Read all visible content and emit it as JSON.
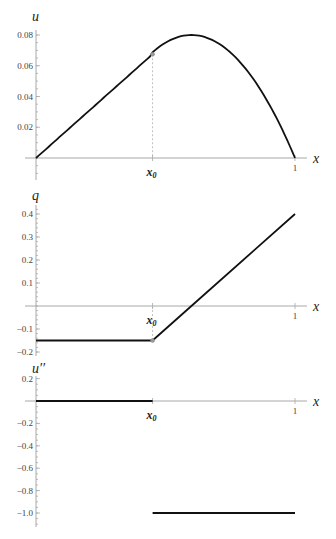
{
  "chart_data": [
    {
      "type": "line",
      "title": "",
      "ylabel": "u",
      "xlabel": "x",
      "x0": 0.45,
      "x0_label": "x0",
      "xlim": [
        0,
        1
      ],
      "ylim": [
        0,
        0.08
      ],
      "yticks": [
        0.02,
        0.04,
        0.06,
        0.08
      ],
      "ytick_labels": [
        "0.02",
        "0.04",
        "0.06",
        "0.08"
      ],
      "xticks": [
        1
      ],
      "xtick_labels": [
        "1"
      ],
      "grid": false,
      "series": [
        {
          "name": "u",
          "x": [
            0,
            0.1,
            0.2,
            0.3,
            0.45,
            0.5,
            0.55,
            0.6,
            0.65,
            0.7,
            0.75,
            0.8,
            0.85,
            0.9,
            0.95,
            1.0
          ],
          "values": [
            0,
            0.015,
            0.03,
            0.045,
            0.06875,
            0.075,
            0.07875,
            0.08,
            0.07875,
            0.075,
            0.06875,
            0.06,
            0.04875,
            0.035,
            0.01875,
            0
          ]
        }
      ]
    },
    {
      "type": "line",
      "title": "",
      "ylabel": "q",
      "xlabel": "x",
      "x0": 0.45,
      "x0_label": "x0",
      "xlim": [
        0,
        1
      ],
      "ylim": [
        -0.2,
        0.4
      ],
      "yticks": [
        -0.2,
        -0.1,
        0.1,
        0.2,
        0.3,
        0.4
      ],
      "ytick_labels": [
        "-0.2",
        "-0.1",
        "0.1",
        "0.2",
        "0.3",
        "0.4"
      ],
      "xticks": [
        1
      ],
      "xtick_labels": [
        "1"
      ],
      "grid": false,
      "series": [
        {
          "name": "q",
          "x": [
            0,
            0.45,
            0.6,
            1.0
          ],
          "values": [
            -0.15,
            -0.15,
            0,
            0.4
          ]
        }
      ]
    },
    {
      "type": "line",
      "title": "",
      "ylabel": "u''",
      "xlabel": "x",
      "x0": 0.45,
      "x0_label": "x0",
      "xlim": [
        0,
        1
      ],
      "ylim": [
        -1.1,
        0.2
      ],
      "yticks": [
        -1.0,
        -0.8,
        -0.6,
        -0.4,
        -0.2,
        0.2
      ],
      "ytick_labels": [
        "-1.0",
        "-0.8",
        "-0.6",
        "-0.4",
        "-0.2",
        "0.2"
      ],
      "xticks": [
        1
      ],
      "xtick_labels": [
        "1"
      ],
      "grid": false,
      "series": [
        {
          "name": "u'' (x < x0)",
          "x": [
            0,
            0.45
          ],
          "values": [
            0,
            0
          ]
        },
        {
          "name": "u'' (x > x0)",
          "x": [
            0.45,
            1.0
          ],
          "values": [
            -1.0,
            -1.0
          ]
        }
      ]
    }
  ],
  "labels": {
    "panel1_y": "u",
    "panel2_y": "q",
    "panel3_y": "u′′",
    "x_axis": "x",
    "x0": "x",
    "x0_sub": "0",
    "one": "1"
  }
}
